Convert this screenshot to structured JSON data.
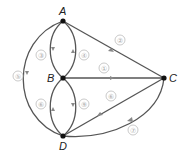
{
  "diagram": {
    "type": "directed multigraph",
    "nodes": [
      {
        "id": "A",
        "label": "A",
        "x": 63,
        "y": 21
      },
      {
        "id": "B",
        "label": "B",
        "x": 63,
        "y": 78
      },
      {
        "id": "C",
        "label": "C",
        "x": 164,
        "y": 78
      },
      {
        "id": "D",
        "label": "D",
        "x": 63,
        "y": 136
      }
    ],
    "edges": [
      {
        "id": "e1",
        "label": "①",
        "from": "B",
        "to": "C"
      },
      {
        "id": "e2",
        "label": "②",
        "from": "A",
        "to": "C"
      },
      {
        "id": "e3",
        "label": "③",
        "from": "A",
        "to": "B"
      },
      {
        "id": "e4",
        "label": "④",
        "from": "B",
        "to": "A"
      },
      {
        "id": "e5",
        "label": "⑤",
        "from": "A",
        "to": "D"
      },
      {
        "id": "e6a",
        "label": "⑥",
        "from": "D",
        "to": "B"
      },
      {
        "id": "e9",
        "label": "⑨",
        "from": "B",
        "to": "D"
      },
      {
        "id": "e6b",
        "label": "⑥",
        "from": "C",
        "to": "D"
      },
      {
        "id": "e7",
        "label": "⑦",
        "from": "C",
        "to": "D"
      }
    ]
  },
  "colors": {
    "edge": "#555555",
    "node": "#111111",
    "edge_label": "#aaaaaa"
  }
}
